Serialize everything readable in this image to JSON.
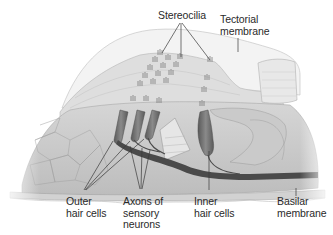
{
  "diagram": {
    "labels": {
      "stereocilia": "Stereocilia",
      "tectorial_membrane": "Tectorial\nmembrane",
      "outer_hair_cells": "Outer\nhair cells",
      "axons": "Axons of\nsensory\nneurons",
      "inner_hair_cells": "Inner\nhair cells",
      "basilar_membrane": "Basilar\nmembrane"
    },
    "colors": {
      "background": "#ffffff",
      "tissue_light": "#e4e4e4",
      "tissue_mid": "#c8c8c8",
      "tissue_dark": "#8a8a8a",
      "hair_cell": "#6e6e6e",
      "axon": "#4a4a4a",
      "leader_line": "#3a3a3a",
      "text": "#2a2a2a"
    }
  }
}
